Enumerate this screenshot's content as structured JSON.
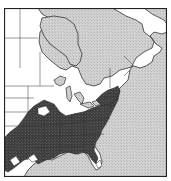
{
  "map": {
    "type": "species-range-map",
    "region": "Eastern North America",
    "colors": {
      "water": "#c8c8c8",
      "land": "#ffffff",
      "range": "#4a4a4a",
      "border": "#333333"
    },
    "legend": []
  }
}
